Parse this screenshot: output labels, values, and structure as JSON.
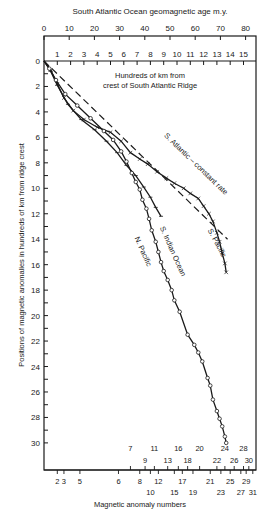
{
  "chart_data": {
    "type": "line",
    "title": "South Atlantic Ocean geomagnetic age m.y.",
    "top_axis": {
      "label": "South Atlantic Ocean geomagnetic age m.y.",
      "ticks": [
        0,
        10,
        20,
        30,
        40,
        50,
        60,
        70,
        80
      ],
      "range": [
        0,
        80
      ]
    },
    "km_axis": {
      "label_line1": "Hundreds of km from",
      "label_line2": "crest of South Atlantic Ridge",
      "ticks": [
        1,
        2,
        3,
        4,
        5,
        6,
        7,
        8,
        9,
        10,
        11,
        12,
        13,
        14,
        15
      ],
      "range": [
        0,
        16
      ]
    },
    "ylabel": "Positions of magnetic anomalies in hundreds of km from ridge crest",
    "yticks": [
      0,
      2,
      4,
      6,
      8,
      10,
      12,
      14,
      16,
      18,
      20,
      22,
      24,
      26,
      28,
      30
    ],
    "ylim": [
      0,
      30
    ],
    "y_inverted": true,
    "xlabel": "Magnetic anomaly numbers",
    "anomaly_ticks": [
      {
        "n": "2",
        "km": 1.0,
        "row": 0
      },
      {
        "n": "3",
        "km": 1.5,
        "row": 0
      },
      {
        "n": "5",
        "km": 2.7,
        "row": 0
      },
      {
        "n": "6",
        "km": 5.6,
        "row": 0
      },
      {
        "n": "7",
        "km": 6.5,
        "row": 1
      },
      {
        "n": "8",
        "km": 7.2,
        "row": 0
      },
      {
        "n": "9",
        "km": 7.6,
        "row": 2
      },
      {
        "n": "10",
        "km": 8.0,
        "row": 3
      },
      {
        "n": "11",
        "km": 8.3,
        "row": 1
      },
      {
        "n": "12",
        "km": 8.6,
        "row": 0
      },
      {
        "n": "13",
        "km": 9.3,
        "row": 2
      },
      {
        "n": "15",
        "km": 9.8,
        "row": 3
      },
      {
        "n": "16",
        "km": 10.1,
        "row": 1
      },
      {
        "n": "17",
        "km": 10.4,
        "row": 0
      },
      {
        "n": "18",
        "km": 10.8,
        "row": 2
      },
      {
        "n": "19",
        "km": 11.2,
        "row": 3
      },
      {
        "n": "20",
        "km": 11.7,
        "row": 1
      },
      {
        "n": "21",
        "km": 12.5,
        "row": 0
      },
      {
        "n": "22",
        "km": 13.0,
        "row": 2
      },
      {
        "n": "23",
        "km": 13.3,
        "row": 3
      },
      {
        "n": "24",
        "km": 13.6,
        "row": 1
      },
      {
        "n": "25",
        "km": 14.0,
        "row": 0
      },
      {
        "n": "26",
        "km": 14.3,
        "row": 2
      },
      {
        "n": "27",
        "km": 14.8,
        "row": 3
      },
      {
        "n": "28",
        "km": 15.0,
        "row": 1
      },
      {
        "n": "29",
        "km": 15.2,
        "row": 0
      },
      {
        "n": "30",
        "km": 15.4,
        "row": 2
      },
      {
        "n": "31",
        "km": 15.7,
        "row": 3
      }
    ],
    "series": [
      {
        "name": "S. Atlantic – constant rate",
        "style": "dashed",
        "points": [
          [
            0,
            0
          ],
          [
            13.8,
            14.0
          ]
        ]
      },
      {
        "name": "S. Pacific",
        "style": "solid-cross",
        "points": [
          [
            0,
            0
          ],
          [
            0.5,
            0.7
          ],
          [
            1.0,
            1.8
          ],
          [
            1.5,
            2.9
          ],
          [
            2.2,
            3.9
          ],
          [
            3.0,
            4.6
          ],
          [
            4.0,
            5.2
          ],
          [
            5.0,
            5.6
          ],
          [
            5.8,
            6.3
          ],
          [
            6.5,
            7.2
          ],
          [
            7.2,
            7.7
          ],
          [
            7.8,
            8.1
          ],
          [
            8.5,
            8.7
          ],
          [
            9.2,
            9.2
          ],
          [
            9.8,
            9.6
          ],
          [
            10.5,
            10.0
          ],
          [
            11.0,
            10.4
          ],
          [
            11.6,
            10.8
          ],
          [
            12.0,
            11.4
          ],
          [
            12.4,
            12.0
          ],
          [
            12.7,
            12.6
          ],
          [
            13.0,
            13.5
          ],
          [
            13.2,
            14.2
          ],
          [
            13.4,
            15.1
          ],
          [
            13.6,
            15.9
          ],
          [
            13.7,
            16.6
          ]
        ]
      },
      {
        "name": "S. Indian Ocean",
        "style": "solid-tick",
        "points": [
          [
            0,
            0
          ],
          [
            0.5,
            0.8
          ],
          [
            1.0,
            1.9
          ],
          [
            1.8,
            3.4
          ],
          [
            2.8,
            4.6
          ],
          [
            3.8,
            5.4
          ],
          [
            4.7,
            6.3
          ],
          [
            5.5,
            7.2
          ],
          [
            6.2,
            8.2
          ],
          [
            6.9,
            9.0
          ],
          [
            7.5,
            9.9
          ],
          [
            8.0,
            10.7
          ],
          [
            8.4,
            11.5
          ],
          [
            8.8,
            12.2
          ]
        ]
      },
      {
        "name": "N. Pacific",
        "style": "solid-circle",
        "points": [
          [
            0,
            0
          ],
          [
            0.4,
            0.6
          ],
          [
            0.9,
            1.5
          ],
          [
            1.6,
            2.6
          ],
          [
            2.5,
            3.5
          ],
          [
            3.5,
            4.5
          ],
          [
            4.5,
            5.5
          ],
          [
            5.2,
            6.2
          ],
          [
            5.8,
            7.1
          ],
          [
            6.2,
            7.9
          ],
          [
            6.6,
            8.8
          ],
          [
            6.9,
            9.5
          ],
          [
            7.2,
            10.1
          ],
          [
            7.4,
            10.9
          ],
          [
            7.7,
            11.6
          ],
          [
            7.9,
            12.4
          ],
          [
            8.1,
            13.3
          ],
          [
            8.4,
            14.2
          ],
          [
            8.6,
            15.0
          ],
          [
            8.8,
            15.8
          ],
          [
            9.0,
            16.5
          ],
          [
            9.3,
            17.2
          ],
          [
            9.6,
            18.0
          ],
          [
            9.8,
            18.8
          ],
          [
            10.2,
            19.7
          ],
          [
            10.8,
            21.5
          ],
          [
            11.3,
            22.3
          ],
          [
            11.6,
            22.9
          ],
          [
            11.9,
            23.6
          ],
          [
            12.3,
            24.9
          ],
          [
            12.5,
            25.5
          ],
          [
            12.7,
            26.6
          ],
          [
            13.0,
            27.5
          ],
          [
            13.2,
            28.1
          ],
          [
            13.4,
            28.7
          ],
          [
            13.6,
            29.5
          ],
          [
            13.7,
            30.0
          ]
        ]
      }
    ],
    "annotations": [
      {
        "text": "S. Atlantic – constant rate",
        "km": 9.0,
        "depth": 5.9,
        "rotate": 44
      },
      {
        "text": "S. Pacific",
        "km": 12.3,
        "depth": 13.3,
        "rotate": 62
      },
      {
        "text": "S. Indian Ocean",
        "km": 8.7,
        "depth": 13.1,
        "rotate": 66
      },
      {
        "text": "N. Pacific",
        "km": 6.8,
        "depth": 13.9,
        "rotate": 66
      }
    ],
    "grid": false,
    "legend": "none (inline labels)"
  }
}
